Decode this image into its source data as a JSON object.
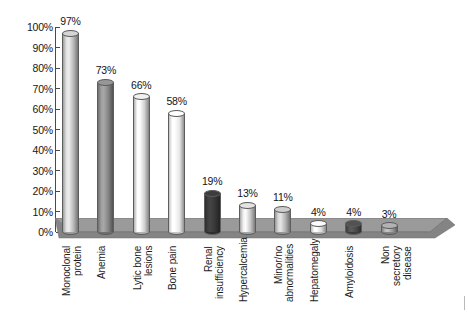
{
  "chart_data": {
    "type": "bar",
    "title": "",
    "xlabel": "",
    "ylabel": "",
    "ylim": [
      0,
      100
    ],
    "grid": false,
    "legend": "none",
    "style": "3d-cylinder",
    "y_ticks": [
      "0%",
      "10%",
      "20%",
      "30%",
      "40%",
      "50%",
      "60%",
      "70%",
      "80%",
      "90%",
      "100%"
    ],
    "categories": [
      "Monoclonal\nprotein",
      "Anemia",
      "Lytic bone\nlesions",
      "Bone pain",
      "Renal\ninsufficiency",
      "Hypercalcemia",
      "Minor/no\nabnormalities",
      "Hepatomegaly",
      "Amyloidosis",
      "Non secretory\ndisease"
    ],
    "values": [
      97,
      73,
      66,
      58,
      19,
      13,
      11,
      4,
      4,
      3
    ],
    "value_labels": [
      "97%",
      "73%",
      "66%",
      "58%",
      "19%",
      "13%",
      "11%",
      "4%",
      "4%",
      "3%"
    ],
    "bar_colors": [
      "#c9c9c9",
      "#8e8e8e",
      "#e3e3e3",
      "#fbfbfb",
      "#3a3a3a",
      "#d6d6d6",
      "#c2c2c2",
      "#ededed",
      "#4d4d4d",
      "#a8a8a8"
    ]
  },
  "axis": {
    "axis_color": "#4a4a4a",
    "floor_top_color": "#9a9a9a",
    "floor_side_color": "#7d7d7d"
  }
}
